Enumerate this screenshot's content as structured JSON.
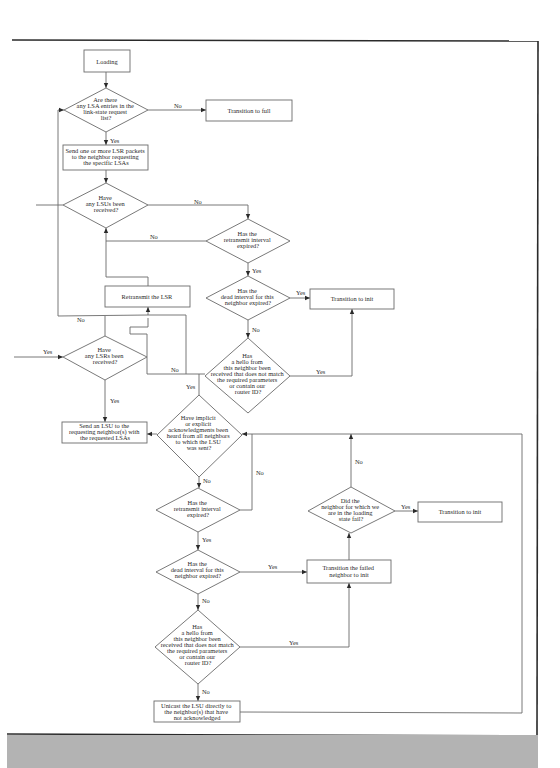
{
  "diagram": {
    "nodes": {
      "loading": {
        "type": "process",
        "lines": [
          "Loading"
        ]
      },
      "q_lsa_entries": {
        "type": "decision",
        "lines": [
          "Are there",
          "any LSA entries in the",
          "link-state request",
          "list?"
        ]
      },
      "transition_full": {
        "type": "process",
        "lines": [
          "Transition to full"
        ]
      },
      "send_lsr": {
        "type": "process",
        "lines": [
          "Send one or more LSR packets",
          "to the neighbor requesting",
          "the specific LSAs"
        ]
      },
      "q_lsus_received": {
        "type": "decision",
        "lines": [
          "Have",
          "any LSUs been",
          "received?"
        ]
      },
      "q_retransmit_1": {
        "type": "decision",
        "lines": [
          "Has the",
          "retransmit interval",
          "expired?"
        ]
      },
      "q_dead_1": {
        "type": "decision",
        "lines": [
          "Has the",
          "dead interval for this",
          "neighbor expired?"
        ]
      },
      "transition_init_1": {
        "type": "process",
        "lines": [
          "Transition to init"
        ]
      },
      "retransmit_lsr": {
        "type": "process",
        "lines": [
          "Retransmit the LSR"
        ]
      },
      "q_hello_1": {
        "type": "decision",
        "lines": [
          "Has",
          "a hello from",
          "this neighbor been",
          "received that does not match",
          "the required parameters",
          "or contain our",
          "router ID?"
        ]
      },
      "q_lsrs_received": {
        "type": "decision",
        "lines": [
          "Have",
          "any LSRs been",
          "received?"
        ]
      },
      "send_lsu": {
        "type": "process",
        "lines": [
          "Send an LSU to the",
          "requesting neighbor(s) with",
          "the requested LSAs"
        ]
      },
      "q_acks": {
        "type": "decision",
        "lines": [
          "Have implicit",
          "or explicit",
          "acknowledgments been",
          "heard from all neighbors",
          "to which the LSU",
          "was sent?"
        ]
      },
      "q_retransmit_2": {
        "type": "decision",
        "lines": [
          "Has the",
          "retransmit interval",
          "expired?"
        ]
      },
      "q_dead_2": {
        "type": "decision",
        "lines": [
          "Has the",
          "dead interval for this",
          "neighbor expired?"
        ]
      },
      "transition_failed": {
        "type": "process",
        "lines": [
          "Transition the failed",
          "neighbor to init"
        ]
      },
      "q_neighbor_fail": {
        "type": "decision",
        "lines": [
          "Did the",
          "neighbor for which we",
          "are in the loading",
          "state fail?"
        ]
      },
      "transition_init_2": {
        "type": "process",
        "lines": [
          "Transition to init"
        ]
      },
      "q_hello_2": {
        "type": "decision",
        "lines": [
          "Has",
          "a hello from",
          "this neighbor been",
          "received that does not match",
          "the required parameters",
          "or contain our",
          "router ID?"
        ]
      },
      "unicast_lsu": {
        "type": "process",
        "lines": [
          "Unicast the LSU directly to",
          "the neighbor(s) that have",
          "not acknowledged"
        ]
      }
    },
    "edge_labels": {
      "lsa_no": "No",
      "lsa_yes": "Yes",
      "lsus_no": "No",
      "retransmit1_no": "No",
      "retransmit1_yes": "Yes",
      "dead1_yes": "Yes",
      "dead1_no": "No",
      "hello1_yes": "Yes",
      "hello1_no": "No",
      "lsrs_loop_no": "No",
      "lsrs_entry_yes": "Yes",
      "lsrs_yes": "Yes",
      "hello1_to_acks_yes": "Yes",
      "acks_no": "No",
      "retransmit2_no": "No",
      "retransmit2_yes": "Yes",
      "dead2_yes": "Yes",
      "dead2_no": "No",
      "neighbor_fail_yes": "Yes",
      "neighbor_fail_no": "No",
      "hello2_yes": "Yes",
      "hello2_no": "No"
    }
  },
  "colors": {
    "line": "#6a6a6a",
    "frame": "#2a2a2a",
    "text": "#2a2a2a",
    "bottom_band": "#b3b3b3",
    "background": "#ffffff"
  }
}
